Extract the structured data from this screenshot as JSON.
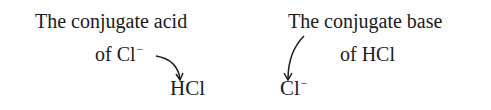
{
  "left": {
    "caption_line1": "The conjugate acid",
    "caption_line2_prefix": "of Cl",
    "caption_line2_charge": "−",
    "species": "HCl"
  },
  "right": {
    "caption_line1": "The conjugate base",
    "caption_line2": "of HCl",
    "species_symbol": "Cl",
    "species_charge": "−"
  },
  "icons": {
    "left_arrow": "curved-arrow-down-right",
    "right_arrow": "curved-arrow-down-left"
  }
}
